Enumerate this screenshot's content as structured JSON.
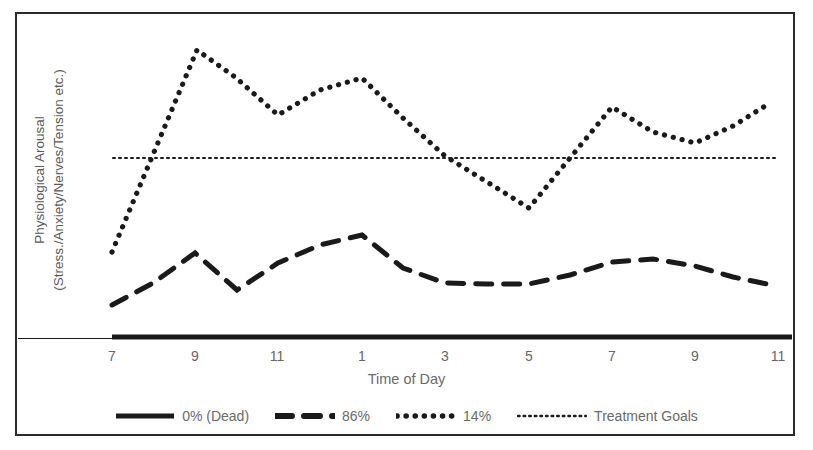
{
  "figure": {
    "frame_color": "#2b2b2b",
    "background": "#ffffff",
    "text_color": "#6a6a6a",
    "line_color": "#1a1a1a"
  },
  "axis": {
    "ylabel_line1": "Physiological Arousal",
    "ylabel_line2": "(Stress./Anxiety/Nerves/Tension etc.)",
    "xlabel": "Time of Day"
  },
  "legend": {
    "items": [
      {
        "label": "0% (Dead)",
        "style": "solid",
        "icon": "solid-line-swatch"
      },
      {
        "label": "86%",
        "style": "dashed",
        "icon": "dashed-line-swatch"
      },
      {
        "label": "14%",
        "style": "dotted",
        "icon": "dotted-line-swatch"
      },
      {
        "label": "Treatment Goals",
        "style": "fine-dotted",
        "icon": "fine-dotted-line-swatch"
      }
    ]
  },
  "chart_data": {
    "type": "line",
    "title": "",
    "subtitle": "",
    "xlabel": "Time of Day",
    "ylabel": "Physiological Arousal (Stress./Anxiety/Nerves/Tension etc.)",
    "grid": false,
    "legend_position": "bottom",
    "x": [
      "7",
      "9",
      "11",
      "1",
      "3",
      "5",
      "7",
      "9",
      "11"
    ],
    "xtick_labels": [
      "7",
      "9",
      "11",
      "1",
      "3",
      "5",
      "7",
      "9",
      "11"
    ],
    "xlim": [
      0,
      8
    ],
    "ylim": [
      0,
      100
    ],
    "yaxis_ticks_shown": false,
    "annotations": [
      "Treatment Goals shown as a flat fine-dotted reference line across the full width at y = 58"
    ],
    "series": [
      {
        "name": "0% (Dead)",
        "style": "solid",
        "linewidth": 4,
        "description": "Flat line lying on the baseline (zero arousal).",
        "x": [
          "7",
          "9",
          "11",
          "1",
          "3",
          "5",
          "7",
          "9",
          "11"
        ],
        "values": [
          0,
          0,
          0,
          0,
          0,
          0,
          0,
          0,
          0
        ]
      },
      {
        "name": "86%",
        "style": "dashed",
        "linewidth": 4,
        "description": "Low-amplitude wave staying well below the treatment-goal line.",
        "x": [
          "7",
          "8",
          "9",
          "10",
          "11",
          "12",
          "1",
          "2",
          "3",
          "4",
          "5",
          "6",
          "7",
          "8",
          "9",
          "10",
          "11"
        ],
        "values": [
          11,
          17,
          27,
          22,
          14,
          22,
          32,
          24,
          18,
          17,
          17,
          21,
          26,
          27,
          24,
          20,
          17
        ]
      },
      {
        "name": "14%",
        "style": "dotted",
        "linewidth": 4,
        "description": "High-amplitude wave that spikes far above the treatment-goal line and dips below it mid-afternoon.",
        "x": [
          "7",
          "9",
          "11",
          "12",
          "1",
          "3",
          "5",
          "7",
          "9",
          "11"
        ],
        "values": [
          28,
          94,
          73,
          81,
          86,
          60,
          44,
          75,
          64,
          77
        ]
      },
      {
        "name": "Treatment Goals",
        "style": "fine-dotted",
        "linewidth": 1.5,
        "description": "Horizontal target threshold.",
        "x": [
          "7",
          "11"
        ],
        "values": [
          58,
          58
        ]
      }
    ]
  },
  "geometry": {
    "plot_left": 112,
    "plot_right": 778,
    "baseline_y": 338,
    "goal_y": 158,
    "xtick_positions": [
      112,
      195,
      277,
      362,
      445,
      529,
      612,
      695,
      778
    ],
    "dotted_points": "112,252 197,50 235,77 278,115 320,90 362,78 403,118 445,156 487,182 529,208 570,158 612,107 653,132 695,143 733,126 770,103",
    "dashed_points": "112,305 153,283 195,253 237,290 278,263 320,245 362,235 403,268 445,283 487,284 529,284 570,275 612,262 653,259 695,266 733,277 772,285"
  }
}
